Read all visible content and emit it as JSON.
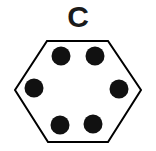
{
  "figure": {
    "label": "C",
    "label_position": "top-center",
    "canvas": {
      "width": 156,
      "height": 151,
      "background_color": "#ffffff"
    },
    "shape": {
      "name": "hexagon",
      "orientation": "pointy-left-right",
      "fill_color": "#ffffff",
      "stroke_color": "#000000",
      "stroke_width": 2,
      "vertices": [
        {
          "x": 47,
          "y": 41
        },
        {
          "x": 108,
          "y": 41
        },
        {
          "x": 141,
          "y": 90
        },
        {
          "x": 108,
          "y": 142
        },
        {
          "x": 48,
          "y": 142
        },
        {
          "x": 15,
          "y": 90
        }
      ]
    },
    "dots": {
      "count": 6,
      "color": "#111111",
      "radius": 9.5,
      "items": [
        {
          "name": "dot-top-left",
          "cx": 61,
          "cy": 56
        },
        {
          "name": "dot-top-right",
          "cx": 95,
          "cy": 56
        },
        {
          "name": "dot-middle-left",
          "cx": 34,
          "cy": 88
        },
        {
          "name": "dot-middle-right",
          "cx": 119,
          "cy": 89
        },
        {
          "name": "dot-bottom-left",
          "cx": 60,
          "cy": 125
        },
        {
          "name": "dot-bottom-right",
          "cx": 93,
          "cy": 124
        }
      ]
    }
  }
}
